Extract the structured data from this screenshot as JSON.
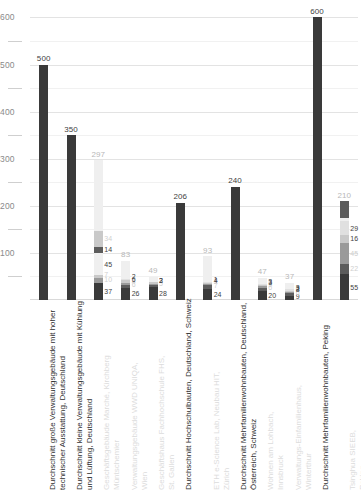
{
  "chart": {
    "type": "bar",
    "subtype": "stacked-bar",
    "title": "",
    "xlabel": "",
    "ylabel": "",
    "ylim": [
      0,
      620
    ],
    "grid": true,
    "legend": "none",
    "y_major_ticks": [
      100,
      200,
      300,
      400,
      500,
      600
    ],
    "y_minor_ticks": [
      50,
      150,
      250,
      350,
      450,
      550
    ],
    "colors": {
      "dark": "#3a3a3a",
      "mid_dark": "#5c5c5c",
      "mid": "#9a9a9a",
      "light": "#c9c9c9",
      "very_light": "#e0e0e0",
      "faint": "#efefef",
      "label_dark": "#3f3f3f",
      "label_faint": "#cfcfcf",
      "grid": "#ececec",
      "axis_text": "#8a8a8a"
    },
    "categories": [
      {
        "label_line1": "Durchschnitt große Verwaltungsgebäude mit hoher",
        "label_line2": "technischer Ausstattung, Deutschland",
        "label_tone": "dark",
        "total": "500",
        "total_value": 500,
        "segments": [
          {
            "value": 500,
            "label": "",
            "tone": "dark"
          }
        ]
      },
      {
        "label_line1": "Durchschnitt kleine Verwaltungsgebäude mit Kühlung",
        "label_line2": "und Lüftung, Deutschland",
        "label_tone": "dark",
        "total": "350",
        "total_value": 350,
        "segments": [
          {
            "value": 350,
            "label": "",
            "tone": "dark"
          }
        ]
      },
      {
        "label_line1": "Geschäftsgebäude Marché, Kirchberg",
        "label_line2": "Müntschemier",
        "label_tone": "faint",
        "total": "297",
        "total_value": 297,
        "segments": [
          {
            "value": 37,
            "label": "37",
            "tone": "dark",
            "label_tone": "dark",
            "side": "right"
          },
          {
            "value": 10,
            "label": "10",
            "tone": "mid",
            "label_tone": "faint",
            "side": "right"
          },
          {
            "value": 7,
            "label": "7",
            "tone": "light",
            "label_tone": "faint",
            "side": "right"
          },
          {
            "value": 45,
            "label": "45",
            "tone": "faint",
            "label_tone": "dark",
            "side": "right"
          },
          {
            "value": 14,
            "label": "14",
            "tone": "mid_dark",
            "label_tone": "dark",
            "side": "right"
          },
          {
            "value": 34,
            "label": "34",
            "tone": "light",
            "label_tone": "faint",
            "side": "right"
          },
          {
            "value": 150,
            "label": "",
            "tone": "faint",
            "side": "right"
          }
        ]
      },
      {
        "label_line1": "Verwaltungsgebäude WWD UNIQA,",
        "label_line2": "Wien",
        "label_tone": "faint",
        "total": "83",
        "total_value": 83,
        "segments": [
          {
            "value": 26,
            "label": "26",
            "tone": "dark",
            "label_tone": "dark",
            "side": "right"
          },
          {
            "value": 6,
            "label": "6",
            "tone": "mid_dark",
            "label_tone": "faint",
            "side": "right"
          },
          {
            "value": 4,
            "label": "4",
            "tone": "mid",
            "label_tone": "faint",
            "side": "right"
          },
          {
            "value": 6,
            "label": "6",
            "tone": "light",
            "label_tone": "dark",
            "side": "right"
          },
          {
            "value": 2,
            "label": "2",
            "tone": "very_light",
            "label_tone": "dark",
            "side": "right"
          },
          {
            "value": 39,
            "label": "",
            "tone": "faint",
            "side": "right"
          }
        ]
      },
      {
        "label_line1": "Geschäftshaus Fachhochschule FHS,",
        "label_line2": "St. Gallen",
        "label_tone": "faint",
        "total": "49",
        "total_value": 49,
        "segments": [
          {
            "value": 28,
            "label": "28",
            "tone": "dark",
            "label_tone": "dark",
            "side": "right"
          },
          {
            "value": 5,
            "label": "5",
            "tone": "mid_dark",
            "label_tone": "faint",
            "side": "right"
          },
          {
            "value": 2,
            "label": "2",
            "tone": "mid",
            "label_tone": "dark",
            "side": "right"
          },
          {
            "value": 3,
            "label": "3",
            "tone": "light",
            "label_tone": "dark",
            "side": "right"
          },
          {
            "value": 11,
            "label": "",
            "tone": "faint",
            "side": "right"
          }
        ]
      },
      {
        "label_line1": "Durchschnitt Hochschulbauten, Deutschland, Schweiz",
        "label_line2": "",
        "label_tone": "dark",
        "total": "206",
        "total_value": 206,
        "segments": [
          {
            "value": 206,
            "label": "",
            "tone": "dark"
          }
        ]
      },
      {
        "label_line1": "ETH e-Science Lab, Neubau HIT,",
        "label_line2": "Zürich",
        "label_tone": "faint",
        "total": "93",
        "total_value": 93,
        "segments": [
          {
            "value": 24,
            "label": "24",
            "tone": "dark",
            "label_tone": "dark",
            "side": "right"
          },
          {
            "value": 7,
            "label": "7",
            "tone": "mid_dark",
            "label_tone": "faint",
            "side": "right"
          },
          {
            "value": 2,
            "label": "2",
            "tone": "mid",
            "label_tone": "faint",
            "side": "right"
          },
          {
            "value": 4,
            "label": "4",
            "tone": "light",
            "label_tone": "dark",
            "side": "right"
          },
          {
            "value": 1,
            "label": "1",
            "tone": "very_light",
            "label_tone": "dark",
            "side": "right"
          },
          {
            "value": 55,
            "label": "",
            "tone": "faint",
            "side": "right"
          }
        ]
      },
      {
        "label_line1": "Durchschnitt Mehrfamilienwohnbauten, Deutschland,",
        "label_line2": "Österreich, Schweiz",
        "label_tone": "dark",
        "total": "240",
        "total_value": 240,
        "segments": [
          {
            "value": 240,
            "label": "",
            "tone": "dark"
          }
        ]
      },
      {
        "label_line1": "Wohnen am Lohbach,",
        "label_line2": "Innsbruck",
        "label_tone": "faint",
        "total": "47",
        "total_value": 47,
        "segments": [
          {
            "value": 20,
            "label": "20",
            "tone": "dark",
            "label_tone": "dark",
            "side": "right"
          },
          {
            "value": 6,
            "label": "6",
            "tone": "mid_dark",
            "label_tone": "faint",
            "side": "right"
          },
          {
            "value": 3,
            "label": "3",
            "tone": "mid",
            "label_tone": "faint",
            "side": "right"
          },
          {
            "value": 3,
            "label": "3",
            "tone": "light",
            "label_tone": "dark",
            "side": "right"
          },
          {
            "value": 3,
            "label": "3",
            "tone": "very_light",
            "label_tone": "dark",
            "side": "right"
          },
          {
            "value": 12,
            "label": "",
            "tone": "faint",
            "side": "right"
          }
        ]
      },
      {
        "label_line1": "Verwaltungs-Einfamilienhaus,",
        "label_line2": "Winterthur",
        "label_tone": "faint",
        "total": "37",
        "total_value": 37,
        "segments": [
          {
            "value": 9,
            "label": "9",
            "tone": "dark",
            "label_tone": "dark",
            "side": "right"
          },
          {
            "value": 6,
            "label": "6",
            "tone": "mid_dark",
            "label_tone": "faint",
            "side": "right"
          },
          {
            "value": 3,
            "label": "3",
            "tone": "mid",
            "label_tone": "dark",
            "side": "right"
          },
          {
            "value": 2,
            "label": "2",
            "tone": "light",
            "label_tone": "dark",
            "side": "right"
          },
          {
            "value": 3,
            "label": "3",
            "tone": "very_light",
            "label_tone": "dark",
            "side": "right"
          },
          {
            "value": 14,
            "label": "",
            "tone": "faint",
            "side": "right"
          }
        ]
      },
      {
        "label_line1": "Durchschnitt Mehrfamilienwohnbauten, Peking",
        "label_line2": "",
        "label_tone": "dark",
        "total": "600",
        "total_value": 600,
        "segments": [
          {
            "value": 600,
            "label": "",
            "tone": "dark"
          }
        ]
      },
      {
        "label_line1": "Tsinghua SIEEB,",
        "label_line2": "Peking",
        "label_tone": "faint",
        "total": "210",
        "total_value": 210,
        "segments": [
          {
            "value": 55,
            "label": "55",
            "tone": "dark",
            "label_tone": "dark",
            "side": "right"
          },
          {
            "value": 22,
            "label": "22",
            "tone": "mid_dark",
            "label_tone": "faint",
            "side": "right"
          },
          {
            "value": 45,
            "label": "45",
            "tone": "mid",
            "label_tone": "faint",
            "side": "right"
          },
          {
            "value": 16,
            "label": "16",
            "tone": "light",
            "label_tone": "dark",
            "side": "right"
          },
          {
            "value": 29,
            "label": "29",
            "tone": "very_light",
            "label_tone": "dark",
            "side": "right"
          },
          {
            "value": 8,
            "label": "",
            "tone": "faint",
            "side": "right"
          },
          {
            "value": 35,
            "label": "",
            "tone": "mid_dark",
            "side": "right"
          }
        ]
      }
    ]
  }
}
